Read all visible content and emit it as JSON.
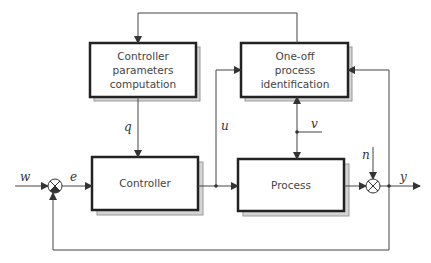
{
  "blocks": {
    "controller_parameters": {
      "label": "Controller parameters computation"
    },
    "identification": {
      "label": "One-off process identification"
    },
    "controller": {
      "label": "Controller"
    },
    "process": {
      "label": "Process"
    }
  },
  "signals": {
    "w": "w",
    "e": "e",
    "q": "q",
    "u": "u",
    "v": "v",
    "n": "n",
    "y": "y"
  },
  "colors": {
    "line": "#444444",
    "box_border": "#222222",
    "shadow": "#bdbdbd",
    "text": "#444444"
  }
}
